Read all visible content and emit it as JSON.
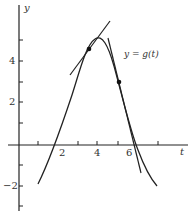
{
  "labels": {
    "y_axis": "y",
    "t_axis": "t",
    "curve": "y = g(t)",
    "tick_4": "4",
    "tick_2": "2",
    "tick_neg2": "−2",
    "t_tick_2": "2",
    "t_tick_4": "4",
    "t_tick_6": "6"
  },
  "colors": {
    "ink": "#222222",
    "background": "#ffffff"
  }
}
